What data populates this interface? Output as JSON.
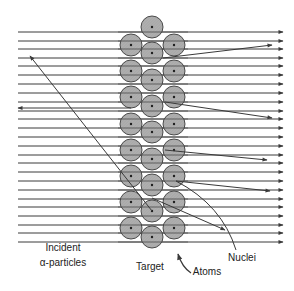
{
  "figure": {
    "labels": {
      "incident_line1": "Incident",
      "incident_line2": "α-particles",
      "target": "Target",
      "atoms": "Atoms",
      "nuclei": "Nuclei"
    },
    "colors": {
      "line": "#3a3a3a",
      "atom_fill": "#a9a9a9",
      "atom_stroke": "#4a4a4a",
      "nucleus": "#1e1e1e"
    },
    "beam": {
      "x_start": 18,
      "x_end": 283,
      "y_positions": [
        32,
        41,
        49,
        58,
        66,
        75,
        84,
        93,
        102,
        111,
        119,
        128,
        137,
        146,
        155,
        163,
        172,
        181,
        190,
        199,
        207,
        216,
        225,
        233,
        242
      ]
    },
    "atoms": {
      "radius": 11,
      "columns": [
        {
          "x": 131,
          "y": [
            45,
            71,
            97,
            124,
            150,
            176,
            202,
            228
          ]
        },
        {
          "x": 152,
          "y": [
            27,
            53,
            80,
            106,
            132,
            159,
            185,
            211,
            237
          ]
        },
        {
          "x": 174,
          "y": [
            45,
            71,
            97,
            124,
            150,
            176,
            202,
            228
          ]
        }
      ]
    },
    "deflections": [
      {
        "from": [
          163,
          58
        ],
        "to": [
          272,
          45
        ]
      },
      {
        "from": [
          165,
          102
        ],
        "to": [
          272,
          118
        ]
      },
      {
        "from": [
          165,
          150
        ],
        "to": [
          267,
          160
        ]
      },
      {
        "from": [
          176,
          181
        ],
        "to": [
          270,
          191
        ]
      },
      {
        "from": [
          152,
          198
        ],
        "to": [
          225,
          230
        ]
      }
    ],
    "backscatter": [
      {
        "path": [
          [
            18,
            108
          ],
          [
            131,
            108
          ]
        ],
        "arrow_at": [
          18,
          108
        ]
      },
      {
        "path": [
          [
            152,
            211
          ],
          [
            30,
            56
          ]
        ],
        "arrow_at": [
          30,
          56
        ]
      }
    ]
  }
}
